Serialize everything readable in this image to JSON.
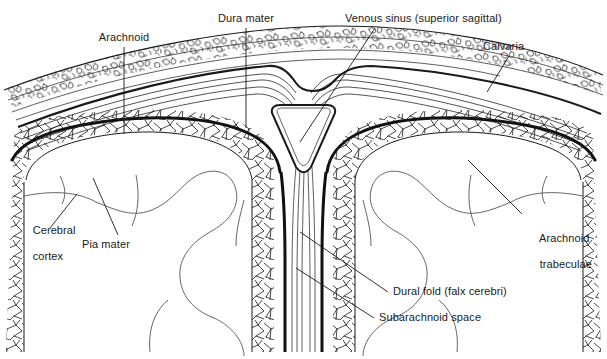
{
  "figure": {
    "type": "anatomical-line-diagram",
    "background_color": "#ffffff",
    "ink_color": "#1a1a1a",
    "label_font_size_px": 11
  },
  "labels": {
    "arachnoid": "Arachnoid",
    "dura_mater": "Dura mater",
    "venous_sinus": "Venous sinus (superior sagittal)",
    "calvaria": "Calvaria",
    "cerebral_cortex_line1": "Cerebral",
    "cerebral_cortex_line2": "cortex",
    "pia_mater": "Pia mater",
    "arachnoid_trabeculae_line1": "Arachnoid",
    "arachnoid_trabeculae_line2": "trabeculae",
    "dural_fold": "Dural fold (falx cerebri)",
    "subarachnoid_space": "Subarachnoid space"
  },
  "structures": [
    {
      "name": "calvaria",
      "description": "Skull vault with cancellous/trabecular bone texture arching across the top"
    },
    {
      "name": "dura-mater",
      "description": "Thick fibrous layer beneath the calvaria, splits to enclose the venous sinus"
    },
    {
      "name": "venous-sinus",
      "description": "Triangular lumen of the superior sagittal sinus at the midline apex"
    },
    {
      "name": "arachnoid-membrane",
      "description": "Heavy dark line bounding the subarachnoid space"
    },
    {
      "name": "subarachnoid-space",
      "description": "Space containing the web-like arachnoid trabeculae"
    },
    {
      "name": "arachnoid-trabeculae",
      "description": "Mesh of fine strands spanning the subarachnoid space"
    },
    {
      "name": "pia-mater",
      "description": "Thin membrane hugging the cortical surface"
    },
    {
      "name": "cerebral-cortex",
      "description": "Brain surface with gyri and sulci on both hemispheres"
    },
    {
      "name": "dural-fold",
      "description": "Falx cerebri descending in the midline between hemispheres"
    }
  ]
}
